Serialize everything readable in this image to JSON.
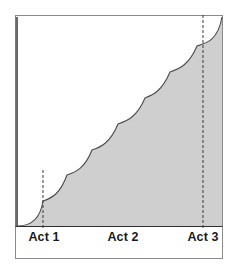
{
  "diagram": {
    "type": "step-curve",
    "colors": {
      "background": "#ffffff",
      "frame": "#7a7a7a",
      "axis": "#555555",
      "fill": "#cfcfcf",
      "curve": "#4a4a4a",
      "dashed_marker": "#3a3a3a",
      "label": "#1a1a1a"
    },
    "acts": [
      {
        "label": "Act 1",
        "x": 43,
        "marker": "dashed"
      },
      {
        "label": "Act 2",
        "x": 122,
        "marker": "none"
      },
      {
        "label": "Act 3",
        "x": 203,
        "marker": "dashed"
      }
    ],
    "curve_cusps": [
      [
        43,
        201
      ],
      [
        67,
        175
      ],
      [
        92,
        150
      ],
      [
        118,
        124
      ],
      [
        145,
        98
      ],
      [
        170,
        72
      ],
      [
        197,
        46
      ]
    ]
  }
}
